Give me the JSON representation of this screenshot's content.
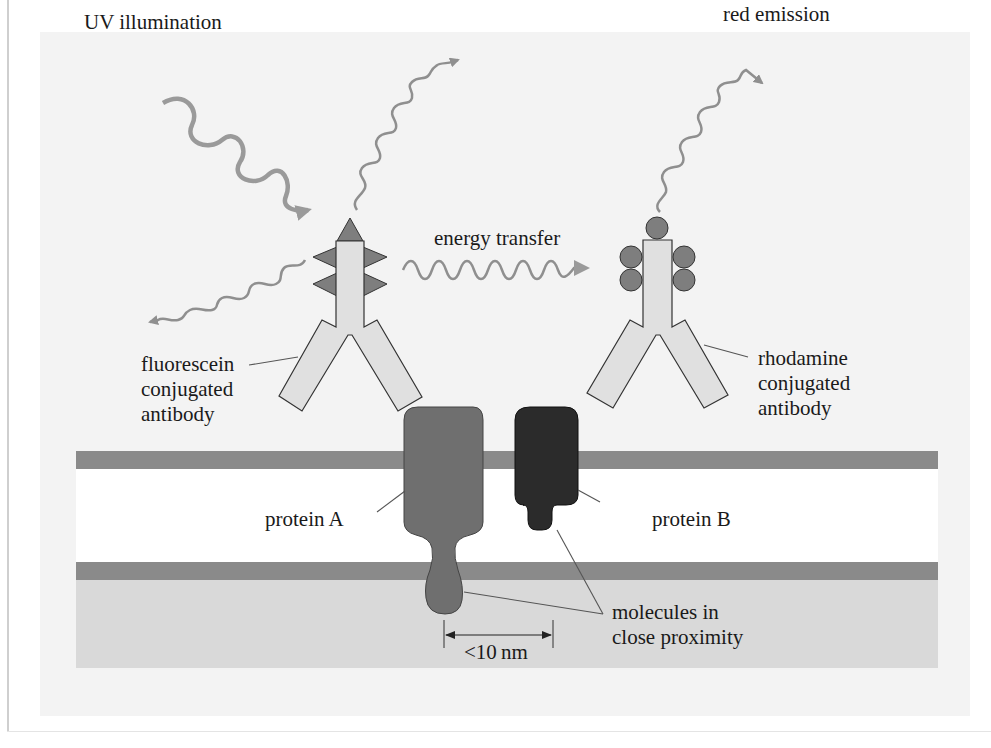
{
  "figure": {
    "labels": {
      "uv_illumination": "UV illumination",
      "red_emission": "red emission",
      "energy_transfer": "energy transfer",
      "fluorescein_antibody": [
        "fluorescein",
        "conjugated",
        "antibody"
      ],
      "rhodamine_antibody": [
        "rhodamine",
        "conjugated",
        "antibody"
      ],
      "protein_a": "protein A",
      "protein_b": "protein B",
      "molecules_close": [
        "molecules in",
        "close proximity"
      ],
      "distance": "<10 nm"
    },
    "colors": {
      "background_panel": "#f3f3f3",
      "membrane_band": "#8a8a8a",
      "membrane_interior": "#ffffff",
      "cytoplasm": "#d9d9d9",
      "antibody_fill": "#e0e0e0",
      "fluorophore": "#7e7e7e",
      "wave": "#8f8f8f",
      "protein_a": "#6f6f6f",
      "protein_b": "#2b2b2b",
      "text": "#1a1a1a"
    }
  }
}
